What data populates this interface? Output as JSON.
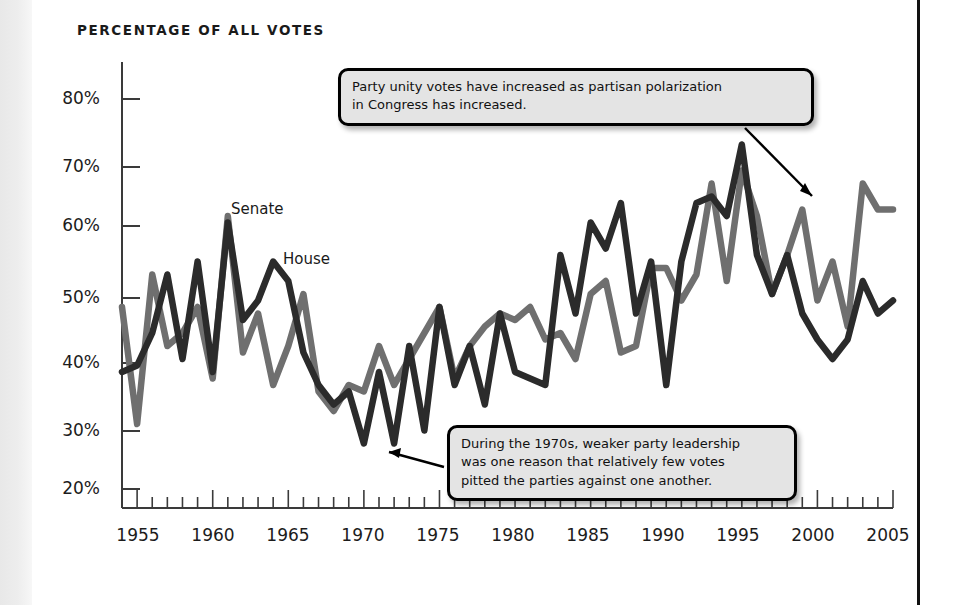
{
  "page": {
    "title": "PERCENTAGE OF ALL VOTES",
    "background_color": "#ffffff",
    "border_color": "#111111"
  },
  "annotations": [
    {
      "name": "callout-top",
      "lines": [
        "Party unity votes have increased as partisan polarization",
        "in Congress has increased."
      ],
      "arrow_points_to": "Senate 2003 peak (67%)"
    },
    {
      "name": "callout-bottom",
      "lines": [
        "During the 1970s, weaker party leadership",
        "was one reason that relatively few votes",
        "pitted the parties against one another."
      ],
      "arrow_points_to": "House 1974 trough (28%)"
    }
  ],
  "series_labels": {
    "senate": "Senate",
    "house": "House"
  },
  "chart_data": {
    "type": "line",
    "title": "PERCENTAGE OF ALL VOTES",
    "xlabel": "",
    "ylabel": "Percentage of all votes",
    "xlim": [
      1954,
      2005
    ],
    "ylim": [
      20,
      85
    ],
    "ytick_labels": [
      "20%",
      "30%",
      "40%",
      "50%",
      "60%",
      "70%",
      "80%"
    ],
    "ytick_values": [
      20,
      30,
      40,
      50,
      60,
      70,
      80
    ],
    "xtick_labels": [
      "1955",
      "1960",
      "1965",
      "1970",
      "1975",
      "1980",
      "1985",
      "1990",
      "1995",
      "2000",
      "2005"
    ],
    "xtick_values": [
      1955,
      1960,
      1965,
      1970,
      1975,
      1980,
      1985,
      1990,
      1995,
      2000,
      2005
    ],
    "minor_xtick_interval": 1,
    "grid": false,
    "legend": "inline-labels",
    "x": [
      1954,
      1955,
      1956,
      1957,
      1958,
      1959,
      1960,
      1961,
      1962,
      1963,
      1964,
      1965,
      1966,
      1967,
      1968,
      1969,
      1970,
      1971,
      1972,
      1973,
      1974,
      1975,
      1976,
      1977,
      1978,
      1979,
      1980,
      1981,
      1982,
      1983,
      1984,
      1985,
      1986,
      1987,
      1988,
      1989,
      1990,
      1991,
      1992,
      1993,
      1994,
      1995,
      1996,
      1997,
      1998,
      1999,
      2000,
      2001,
      2002,
      2003,
      2004,
      2005
    ],
    "series": [
      {
        "name": "House",
        "color": "#2b2b2b",
        "values": [
          38,
          39,
          44,
          53,
          40,
          55,
          38,
          61,
          46,
          49,
          55,
          52,
          41,
          36,
          33,
          35,
          27,
          38,
          27,
          42,
          29,
          48,
          36,
          42,
          33,
          47,
          38,
          37,
          36,
          56,
          47,
          61,
          57,
          64,
          47,
          55,
          36,
          55,
          64,
          65,
          62,
          73,
          56,
          50,
          56,
          47,
          43,
          40,
          43,
          52,
          47,
          49
        ]
      },
      {
        "name": "Senate",
        "color": "#6f6f6f",
        "values": [
          48,
          30,
          53,
          42,
          44,
          48,
          37,
          62,
          41,
          47,
          36,
          42,
          50,
          35,
          32,
          36,
          35,
          42,
          36,
          40,
          44,
          48,
          37,
          42,
          45,
          47,
          46,
          48,
          43,
          44,
          40,
          50,
          52,
          41,
          42,
          54,
          54,
          49,
          53,
          67,
          52,
          69,
          62,
          50,
          56,
          63,
          49,
          55,
          45,
          67,
          63,
          63
        ]
      }
    ]
  }
}
